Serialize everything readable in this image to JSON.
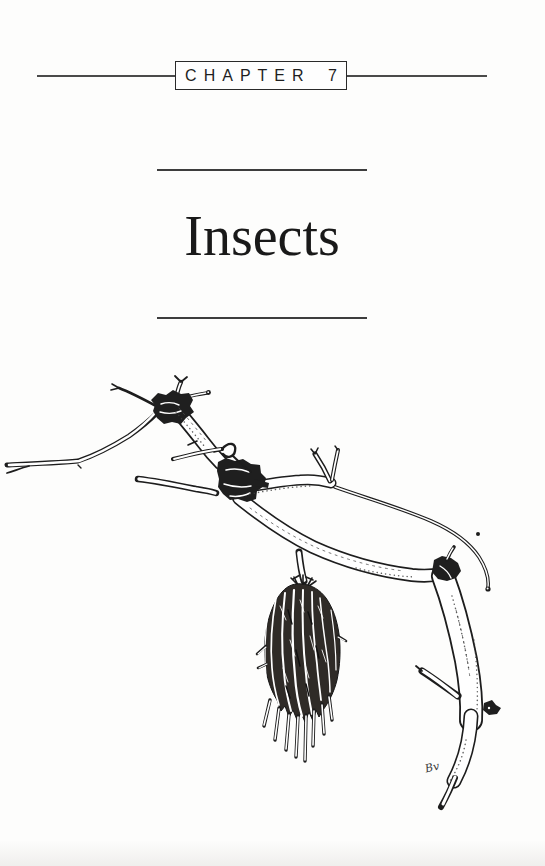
{
  "page": {
    "background": "#fdfdfc",
    "ink_color": "#1d1d1d",
    "rule_color": "#3d3d3d"
  },
  "header": {
    "chapter_label": "CHAPTER 7"
  },
  "title_block": {
    "title": "Insects"
  },
  "illustration": {
    "alt": "Pen-and-ink drawing of a bare, gnarled branch with a bagworm case hanging beneath it",
    "monogram": "Bv"
  }
}
